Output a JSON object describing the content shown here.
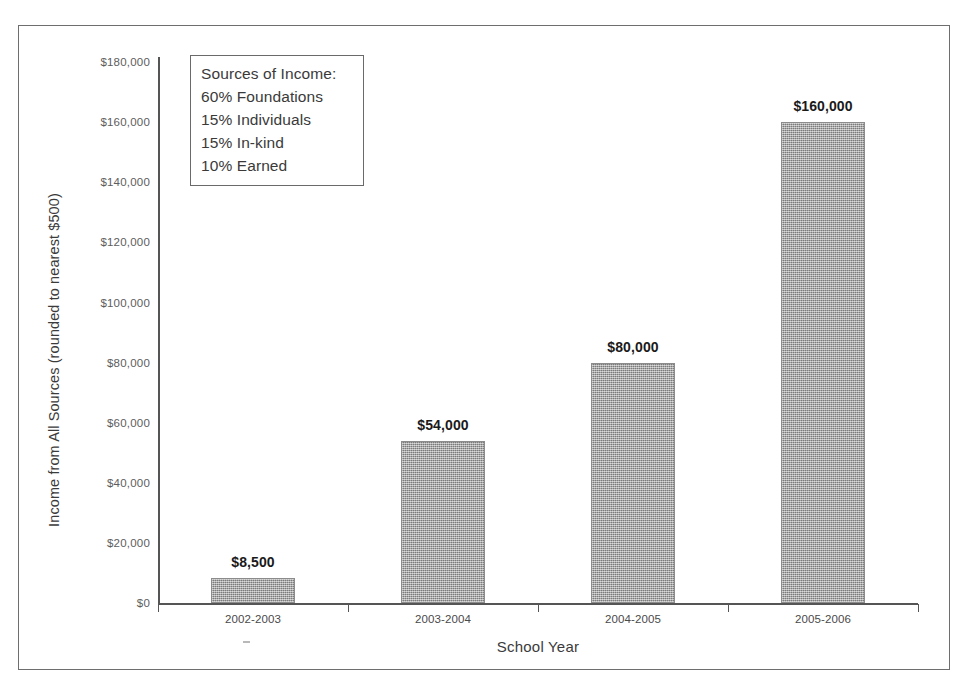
{
  "chart_data": {
    "type": "bar",
    "title": "",
    "xlabel": "School Year",
    "ylabel": "Income from All Sources (rounded to nearest $500)",
    "categories": [
      "2002-2003",
      "2003-2004",
      "2004-2005",
      "2005-2006"
    ],
    "values": [
      8500,
      54000,
      80000,
      160000
    ],
    "value_labels": [
      "$8,500",
      "$54,000",
      "$80,000",
      "$160,000"
    ],
    "ylim": [
      0,
      180000
    ],
    "ytick_values": [
      0,
      20000,
      40000,
      60000,
      80000,
      100000,
      120000,
      140000,
      160000,
      180000
    ],
    "ytick_labels": [
      "$0",
      "$20,000",
      "$40,000",
      "$60,000",
      "$80,000",
      "$100,000",
      "$120,000",
      "$140,000",
      "$160,000",
      "$180,000"
    ],
    "grid": false,
    "legend_position": "inside-top-left",
    "bar_color": "#9c9c9c",
    "axis_color": "#555555",
    "text_color": "#3a3a3a"
  },
  "annotation_box": {
    "title": "Sources of Income:",
    "lines": [
      "60% Foundations",
      "15% Individuals",
      "15% In-kind",
      "10% Earned"
    ]
  }
}
